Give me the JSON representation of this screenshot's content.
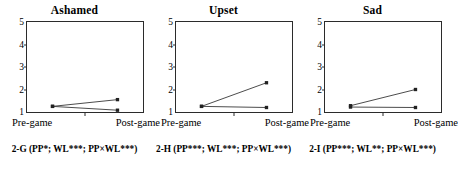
{
  "figure": {
    "panel_count": 3,
    "axis": {
      "y_ticks": [
        "1",
        "2",
        "3",
        "4",
        "5"
      ],
      "y_min": 1,
      "y_max": 5,
      "x_ticks": [
        "Pre-game",
        "Post-game"
      ]
    }
  },
  "panels": [
    {
      "title": "Ashamed",
      "caption": "2-G (PP*; WL***; PP×WL***)",
      "xlabel_left": "Pre-game",
      "xlabel_right": "Post-game"
    },
    {
      "title": "Upset",
      "caption": "2-H (PP***; WL***; PP×WL***)",
      "xlabel_left": "Pre-game",
      "xlabel_right": "Post-game"
    },
    {
      "title": "Sad",
      "caption": "2-I (PP***; WL**; PP×WL***)",
      "xlabel_left": "Pre-game",
      "xlabel_right": "Post-game"
    }
  ],
  "chart_data": [
    {
      "type": "line",
      "title": "Ashamed",
      "panel_id": "2-G",
      "categories": [
        "Pre-game",
        "Post-game"
      ],
      "series": [
        {
          "name": "Series 1",
          "values": [
            1.25,
            1.55
          ]
        },
        {
          "name": "Series 2",
          "values": [
            1.25,
            1.08
          ]
        }
      ],
      "xlabel": "",
      "ylabel": "",
      "ylim": [
        1,
        5
      ],
      "yticks": [
        1,
        2,
        3,
        4,
        5
      ],
      "grid": false,
      "legend": "none",
      "marker": "square",
      "color": "#333333",
      "annotation": "2-G (PP*; WL***; PP×WL***)"
    },
    {
      "type": "line",
      "title": "Upset",
      "panel_id": "2-H",
      "categories": [
        "Pre-game",
        "Post-game"
      ],
      "series": [
        {
          "name": "Series 1",
          "values": [
            1.25,
            2.3
          ]
        },
        {
          "name": "Series 2",
          "values": [
            1.25,
            1.2
          ]
        }
      ],
      "xlabel": "",
      "ylabel": "",
      "ylim": [
        1,
        5
      ],
      "yticks": [
        1,
        2,
        3,
        4,
        5
      ],
      "grid": false,
      "legend": "none",
      "marker": "square",
      "color": "#333333",
      "annotation": "2-H (PP***; WL***; PP×WL***)"
    },
    {
      "type": "line",
      "title": "Sad",
      "panel_id": "2-I",
      "categories": [
        "Pre-game",
        "Post-game"
      ],
      "series": [
        {
          "name": "Series 1",
          "values": [
            1.28,
            2.0
          ]
        },
        {
          "name": "Series 2",
          "values": [
            1.22,
            1.2
          ]
        }
      ],
      "xlabel": "",
      "ylabel": "",
      "ylim": [
        1,
        5
      ],
      "yticks": [
        1,
        2,
        3,
        4,
        5
      ],
      "grid": false,
      "legend": "none",
      "marker": "square",
      "color": "#333333",
      "annotation": "2-I (PP***; WL**; PP×WL***)"
    }
  ]
}
